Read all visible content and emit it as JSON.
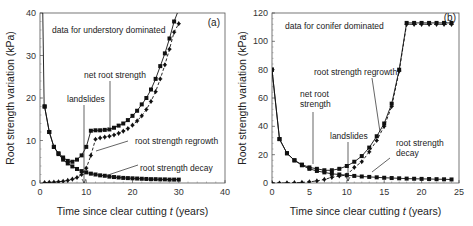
{
  "chart_data": [
    {
      "type": "line",
      "panel": "(a)",
      "title": "data for understory dominated",
      "xlabel": "Time since clear cutting t (years)",
      "ylabel": "Root strength variation (kPa)",
      "xlim": [
        0,
        40
      ],
      "ylim": [
        0,
        40
      ],
      "xticks": [
        0,
        10,
        20,
        30,
        40
      ],
      "yticks": [
        0,
        10,
        20,
        30,
        40
      ],
      "grid": false,
      "annotations": [
        "net root strength",
        "landslides",
        "root strength regrowth",
        "root strength decay"
      ],
      "landslides_t": 10,
      "series": [
        {
          "name": "net root strength",
          "marker": "square",
          "x": [
            1,
            2,
            3,
            4,
            5,
            6,
            7,
            8,
            9,
            10,
            11,
            12,
            13,
            14,
            15,
            16,
            17,
            18,
            19,
            20,
            21,
            22,
            23,
            24,
            25,
            26,
            27,
            28,
            29
          ],
          "values": [
            18,
            12,
            8.5,
            7,
            6,
            5.2,
            5,
            5.5,
            6.5,
            8.5,
            12.3,
            12.4,
            12.4,
            12.5,
            12.6,
            13,
            13.5,
            14,
            14.8,
            15.8,
            17,
            18.5,
            20,
            22,
            24.5,
            27.5,
            30.5,
            34,
            38
          ]
        },
        {
          "name": "root strength regrowth",
          "marker": "diamond",
          "x": [
            1,
            2,
            3,
            4,
            5,
            6,
            7,
            8,
            9,
            10,
            11,
            12,
            13,
            14,
            15,
            16,
            17,
            18,
            19,
            20,
            21,
            22,
            23,
            24,
            25,
            26,
            27,
            28,
            29,
            30
          ],
          "values": [
            0.1,
            0.15,
            0.2,
            0.3,
            0.4,
            0.6,
            0.9,
            1.3,
            2,
            3.5,
            6.5,
            10.3,
            10.6,
            10.8,
            11,
            11.3,
            11.7,
            12.2,
            12.8,
            13.6,
            14.6,
            15.8,
            17.3,
            19.2,
            21.5,
            24.5,
            27.8,
            31.5,
            35.5,
            37.5
          ]
        },
        {
          "name": "root strength decay",
          "marker": "square",
          "x": [
            1,
            2,
            3,
            4,
            5,
            6,
            7,
            8,
            9,
            10,
            11,
            12,
            13,
            14,
            15,
            16,
            17,
            18,
            19,
            20,
            21,
            22,
            23,
            24,
            25,
            26,
            27,
            28,
            29,
            30
          ],
          "values": [
            18,
            12,
            8.5,
            6.8,
            5.5,
            4.6,
            3.9,
            3.3,
            2.8,
            2.5,
            2.2,
            2,
            1.8,
            1.7,
            1.5,
            1.4,
            1.3,
            1.2,
            1.15,
            1.1,
            1.05,
            1,
            0.95,
            0.9,
            0.9,
            0.85,
            0.85,
            0.8,
            0.8,
            0.8
          ]
        }
      ]
    },
    {
      "type": "line",
      "panel": "(b)",
      "title": "data for conifer dominated",
      "xlabel": "Time since clear cutting t (years)",
      "ylabel": "Root strength variation (kPa)",
      "xlim": [
        0,
        25
      ],
      "ylim": [
        0,
        120
      ],
      "xticks": [
        0,
        5,
        10,
        15,
        20,
        25
      ],
      "yticks": [
        0,
        20,
        40,
        60,
        80,
        100,
        120
      ],
      "grid": false,
      "annotations": [
        "net root strength",
        "landslides",
        "root strength regrowth",
        "root strength decay"
      ],
      "landslides_t": 10,
      "series": [
        {
          "name": "net root strength",
          "marker": "square",
          "x": [
            0,
            1,
            2,
            3,
            4,
            5,
            6,
            7,
            8,
            9,
            10,
            11,
            12,
            13,
            14,
            15,
            16,
            17,
            18,
            19,
            20,
            21,
            22,
            23,
            24
          ],
          "values": [
            80,
            31,
            21,
            16,
            13,
            11,
            10,
            9,
            9,
            10,
            12,
            15,
            19,
            25,
            33,
            42,
            56,
            80,
            113,
            113,
            113,
            113,
            113,
            113,
            113
          ]
        },
        {
          "name": "root strength regrowth",
          "marker": "diamond",
          "x": [
            0,
            1,
            2,
            3,
            4,
            5,
            6,
            7,
            8,
            9,
            10,
            11,
            12,
            13,
            14,
            15,
            16,
            17,
            18,
            19,
            20,
            21,
            22,
            23,
            24
          ],
          "values": [
            0,
            0,
            0.1,
            0.2,
            0.4,
            0.8,
            1.5,
            2.5,
            4,
            5,
            5.5,
            11,
            15,
            22,
            30,
            40,
            54,
            79,
            112,
            112,
            112,
            112,
            112,
            112,
            112
          ]
        },
        {
          "name": "root strength decay",
          "marker": "square",
          "x": [
            0,
            1,
            2,
            3,
            4,
            5,
            6,
            7,
            8,
            9,
            10,
            11,
            12,
            13,
            14,
            15,
            16,
            17,
            18,
            19,
            20,
            21,
            22,
            23,
            24
          ],
          "values": [
            80,
            31,
            21,
            16,
            12.5,
            10,
            8.5,
            7.5,
            6.5,
            6,
            5.5,
            5,
            4.6,
            4.3,
            4,
            3.7,
            3.5,
            3.3,
            3.1,
            3,
            2.9,
            2.8,
            2.7,
            2.6,
            2.5
          ]
        }
      ]
    }
  ]
}
